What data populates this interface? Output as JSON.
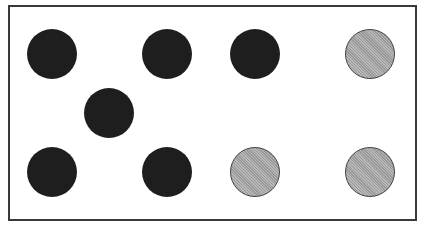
{
  "figure": {
    "frame_color": "#3a3a3a",
    "colors": {
      "dark": "#1e1e1e",
      "gray": "#a9a9a9"
    },
    "dots": [
      {
        "id": "dot-1",
        "color": "dark",
        "cx": 52,
        "cy": 54
      },
      {
        "id": "dot-2",
        "color": "dark",
        "cx": 167,
        "cy": 54
      },
      {
        "id": "dot-3",
        "color": "dark",
        "cx": 255,
        "cy": 54
      },
      {
        "id": "dot-4",
        "color": "gray",
        "cx": 370,
        "cy": 54
      },
      {
        "id": "dot-5",
        "color": "dark",
        "cx": 109,
        "cy": 113
      },
      {
        "id": "dot-6",
        "color": "dark",
        "cx": 52,
        "cy": 172
      },
      {
        "id": "dot-7",
        "color": "dark",
        "cx": 167,
        "cy": 172
      },
      {
        "id": "dot-8",
        "color": "gray",
        "cx": 255,
        "cy": 172
      },
      {
        "id": "dot-9",
        "color": "gray",
        "cx": 370,
        "cy": 172
      }
    ],
    "counts": {
      "dark": 6,
      "gray": 3,
      "total": 9
    }
  }
}
